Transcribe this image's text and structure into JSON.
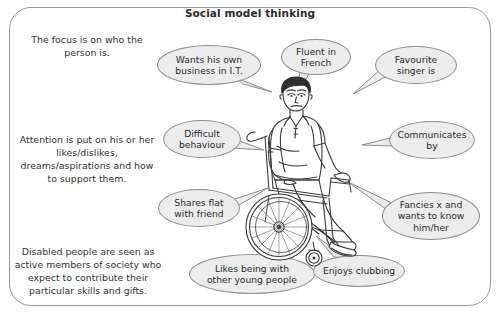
{
  "title": "Social model thinking",
  "paragraphs": [
    {
      "name": "focus",
      "text": "The focus is on who the person is."
    },
    {
      "name": "attention",
      "text": "Attention is put on his or her likes/dislikes, dreams/aspirations and how to support them."
    },
    {
      "name": "disabled",
      "text": "Disabled people are seen as active members of society who expect to contribute their particular skills and gifts."
    }
  ],
  "bubbles": [
    {
      "name": "business",
      "line1": "Wants his own",
      "line2": "business in I.T."
    },
    {
      "name": "french",
      "line1": "Fluent in",
      "line2": "French"
    },
    {
      "name": "singer",
      "line1": "Favourite",
      "line2": "singer is"
    },
    {
      "name": "difficult",
      "line1": "Difficult",
      "line2": "behaviour"
    },
    {
      "name": "communicates",
      "line1": "Communicates",
      "line2": "by"
    },
    {
      "name": "flat",
      "line1": "Shares flat",
      "line2": "with friend"
    },
    {
      "name": "fancies",
      "line1": "Fancies x and",
      "line2": "wants to know",
      "line3": "him/her"
    },
    {
      "name": "likes",
      "line1": "Likes being with",
      "line2": "other young people"
    },
    {
      "name": "clubbing",
      "line1": "Enjoys clubbing",
      "line2": ""
    }
  ],
  "illustration": {
    "name": "young-man-in-wheelchair",
    "description": "Line drawing of a young man seated in a manual wheelchair"
  },
  "colors": {
    "frame": "#9a9a9a",
    "bubble_fill": "#ececed",
    "bubble_stroke": "#8d8d8d",
    "text": "#2b2b2b",
    "background": "#ffffff"
  }
}
